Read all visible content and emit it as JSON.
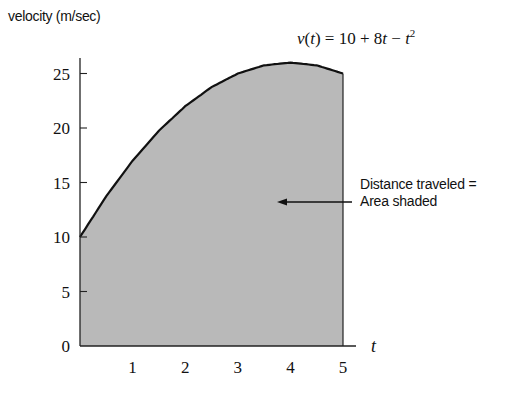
{
  "chart_data": {
    "type": "area",
    "title": "",
    "xlabel": "t",
    "ylabel": "velocity (m/sec)",
    "x_ticks": [
      1,
      2,
      3,
      4,
      5
    ],
    "y_ticks": [
      0,
      5,
      10,
      15,
      20,
      25
    ],
    "xlim": [
      0,
      5
    ],
    "ylim": [
      0,
      26
    ],
    "grid": false,
    "legend": null,
    "series": [
      {
        "name": "v(t) = 10 + 8t - t^2",
        "x": [
          0,
          0.5,
          1,
          1.5,
          2,
          2.5,
          3,
          3.5,
          4,
          4.5,
          5
        ],
        "values": [
          10,
          13.75,
          17,
          19.75,
          22,
          23.75,
          25,
          25.75,
          26,
          25.75,
          25
        ]
      }
    ],
    "shaded_region": {
      "from_t": 0,
      "to_t": 5,
      "meaning": "Distance traveled"
    },
    "annotations": [
      {
        "text": "v(t) = 10 + 8t − t²",
        "position": "top-right"
      },
      {
        "text": "Distance traveled = Area shaded",
        "arrow_to": "shaded area",
        "position": "right"
      }
    ]
  },
  "labels": {
    "ylabel": "velocity (m/sec)",
    "xlabel": "t",
    "formula_lhs": "v(t) = 10 + 8",
    "formula_t1": "t",
    "formula_mid": " − ",
    "formula_t2": "t",
    "formula_exp": "2",
    "annot_line1": "Distance traveled =",
    "annot_line2": "Area shaded"
  },
  "colors": {
    "fill": "#b9b9b9",
    "curve": "#111111",
    "axis": "#222222"
  }
}
